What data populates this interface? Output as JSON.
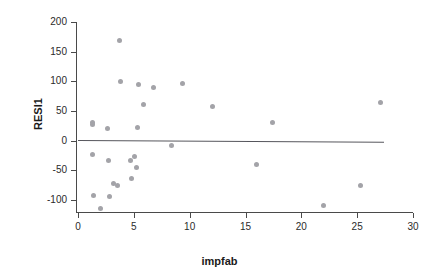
{
  "chart_data": {
    "type": "scatter",
    "title": "",
    "xlabel": "impfab",
    "ylabel": "RESI1",
    "xlim": [
      0,
      30
    ],
    "ylim": [
      -120,
      200
    ],
    "xticks": [
      0,
      5,
      10,
      15,
      20,
      25,
      30
    ],
    "xtick_labels": [
      "0",
      "5",
      "10",
      "15",
      "20",
      "25",
      "30"
    ],
    "yticks": [
      200,
      150,
      100,
      50,
      0,
      -50,
      -100
    ],
    "ytick_labels": [
      "200",
      "150",
      "100",
      "50",
      "0",
      "-50",
      "-100"
    ],
    "grid": false,
    "legend": null,
    "marker_color": "#a3a3a8",
    "line_color": "#56565c",
    "axis_color": "#4a4a4a",
    "series": [
      {
        "name": "RESI1",
        "points": [
          {
            "x": 1.3,
            "y": 31
          },
          {
            "x": 1.3,
            "y": 27
          },
          {
            "x": 1.3,
            "y": -23
          },
          {
            "x": 1.35,
            "y": -93
          },
          {
            "x": 2.0,
            "y": -115
          },
          {
            "x": 2.6,
            "y": 21
          },
          {
            "x": 2.7,
            "y": -33
          },
          {
            "x": 2.85,
            "y": -94
          },
          {
            "x": 3.2,
            "y": -72
          },
          {
            "x": 3.5,
            "y": -75
          },
          {
            "x": 3.75,
            "y": 168
          },
          {
            "x": 3.8,
            "y": 99
          },
          {
            "x": 4.7,
            "y": -33
          },
          {
            "x": 4.8,
            "y": -64
          },
          {
            "x": 5.05,
            "y": -26
          },
          {
            "x": 5.2,
            "y": -45
          },
          {
            "x": 5.3,
            "y": 23
          },
          {
            "x": 5.4,
            "y": 95
          },
          {
            "x": 5.85,
            "y": 61
          },
          {
            "x": 6.8,
            "y": 90
          },
          {
            "x": 8.4,
            "y": -8
          },
          {
            "x": 9.4,
            "y": 96
          },
          {
            "x": 12.0,
            "y": 58
          },
          {
            "x": 16.0,
            "y": -40
          },
          {
            "x": 17.4,
            "y": 30
          },
          {
            "x": 22.0,
            "y": -109
          },
          {
            "x": 25.3,
            "y": -75
          },
          {
            "x": 27.1,
            "y": 64
          }
        ]
      }
    ],
    "fit_line": {
      "name": "regression-line",
      "x_start": 0.0,
      "y_start": 0.5,
      "x_end": 27.4,
      "y_end": -2.5
    }
  }
}
